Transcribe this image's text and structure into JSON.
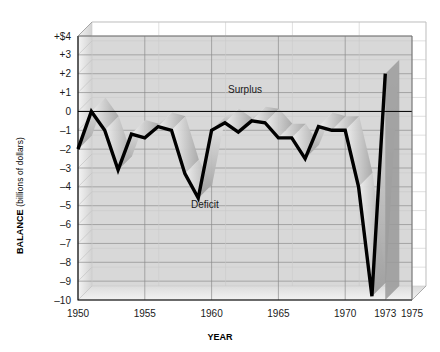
{
  "chart_data": {
    "type": "line",
    "title": "",
    "xlabel": "YEAR",
    "ylabel": "BALANCE (billions of dollars)",
    "ylabel_main": "BALANCE",
    "ylabel_sub": "(billions of dollars)",
    "xlim": [
      1950,
      1975
    ],
    "ylim": [
      -10,
      4
    ],
    "grid": true,
    "legend_position": "none",
    "y_ticks": [
      4,
      3,
      2,
      1,
      0,
      -1,
      -2,
      -3,
      -4,
      -5,
      -6,
      -7,
      -8,
      -9,
      -10
    ],
    "y_tick_labels": [
      "+$4",
      "+3",
      "+2",
      "+1",
      "0",
      "–1",
      "–2",
      "–3",
      "–4",
      "–5",
      "–6",
      "–7",
      "–8",
      "–9",
      "–10"
    ],
    "x_ticks": [
      1950,
      1955,
      1960,
      1965,
      1970,
      1973,
      1975
    ],
    "x_tick_labels": [
      "1950",
      "1955",
      "1960",
      "1965",
      "1970",
      "1973",
      "1975"
    ],
    "x_gridlines": [
      1950,
      1955,
      1960,
      1965,
      1970,
      1975
    ],
    "series": [
      {
        "name": "Balance of payments",
        "x": [
          1950,
          1951,
          1952,
          1953,
          1954,
          1955,
          1956,
          1957,
          1958,
          1959,
          1960,
          1961,
          1962,
          1963,
          1964,
          1965,
          1966,
          1967,
          1968,
          1969,
          1970,
          1971,
          1972,
          1973
        ],
        "values": [
          -2.0,
          0.0,
          -1.0,
          -3.1,
          -1.2,
          -1.4,
          -0.8,
          -1.0,
          -3.3,
          -4.6,
          -1.0,
          -0.6,
          -1.1,
          -0.5,
          -0.6,
          -1.4,
          -1.4,
          -2.5,
          -0.8,
          -1.0,
          -1.0,
          -4.0,
          -9.8,
          2.0
        ]
      }
    ],
    "annotations": [
      {
        "text": "Surplus",
        "x": 1962.5,
        "y": 1.0
      },
      {
        "text": "Deficit",
        "x": 1959.5,
        "y": -5.1
      }
    ],
    "colors": {
      "line": "#000000",
      "plot_background": "#d8d8d8",
      "grid": "#8c8c8c",
      "axis": "#000000",
      "ribbon_light": "#e2e2e2",
      "ribbon_dark": "#9a9a9a",
      "page_background": "#ffffff",
      "text": "#1a1a1a"
    }
  },
  "axes": {
    "x_title": "YEAR",
    "y_title_main": "BALANCE",
    "y_title_sub": "(billions of dollars)"
  }
}
